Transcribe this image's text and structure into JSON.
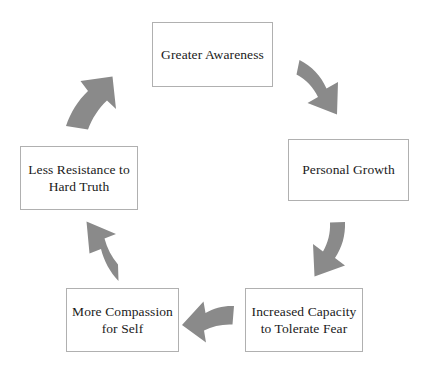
{
  "diagram": {
    "type": "cycle",
    "direction": "clockwise",
    "background_color": "#ffffff",
    "node_border_color": "#b0b0b0",
    "node_fill_color": "#ffffff",
    "text_color": "#1a1a1a",
    "arrow_color": "#8a8a8a",
    "nodes": [
      {
        "id": "awareness",
        "line1": "Greater Awareness",
        "line2": ""
      },
      {
        "id": "growth",
        "line1": "Personal Growth",
        "line2": ""
      },
      {
        "id": "capacity",
        "line1": "Increased Capacity",
        "line2": "to Tolerate Fear"
      },
      {
        "id": "compassion",
        "line1": "More Compassion",
        "line2": "for Self"
      },
      {
        "id": "resistance",
        "line1": "Less Resistance to",
        "line2": "Hard Truth"
      }
    ],
    "arrows": [
      {
        "id": "awareness-to-growth",
        "from": "Greater Awareness",
        "to": "Personal Growth",
        "direction": "down-right"
      },
      {
        "id": "growth-to-capacity",
        "from": "Personal Growth",
        "to": "Increased Capacity to Tolerate Fear",
        "direction": "down-left"
      },
      {
        "id": "capacity-to-compassion",
        "from": "Increased Capacity to Tolerate Fear",
        "to": "More Compassion for Self",
        "direction": "left"
      },
      {
        "id": "compassion-to-resistance",
        "from": "More Compassion for Self",
        "to": "Less Resistance to Hard Truth",
        "direction": "up-left"
      },
      {
        "id": "resistance-to-awareness",
        "from": "Less Resistance to Hard Truth",
        "to": "Greater Awareness",
        "direction": "up-right"
      }
    ]
  }
}
